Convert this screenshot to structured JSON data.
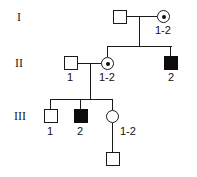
{
  "diagram": {
    "kind": "pedigree-chart",
    "colors": {
      "stroke": "#1a1a1a",
      "affected_fill": "#0d0d0d",
      "unaffected_fill": "#ffffff",
      "background": "#ffffff"
    }
  },
  "generations": [
    {
      "key": "gen1",
      "label": "I"
    },
    {
      "key": "gen2",
      "label": "II"
    },
    {
      "key": "gen3",
      "label": "III"
    }
  ],
  "individuals": [
    {
      "id": "i-1",
      "generation": "I",
      "sex": "male",
      "shape": "square",
      "status": "unaffected",
      "filled": false,
      "carrier": false,
      "label": ""
    },
    {
      "id": "i-2",
      "generation": "I",
      "sex": "female",
      "shape": "circle",
      "status": "carrier",
      "filled": false,
      "carrier": true,
      "label": "1-2"
    },
    {
      "id": "ii-1",
      "generation": "II",
      "sex": "male",
      "shape": "square",
      "status": "unaffected",
      "filled": false,
      "carrier": false,
      "label": "1"
    },
    {
      "id": "ii-2",
      "generation": "II",
      "sex": "female",
      "shape": "circle",
      "status": "carrier",
      "filled": false,
      "carrier": true,
      "label": "1-2"
    },
    {
      "id": "ii-3",
      "generation": "II",
      "sex": "male",
      "shape": "square",
      "status": "affected",
      "filled": true,
      "carrier": false,
      "label": "2"
    },
    {
      "id": "iii-1",
      "generation": "III",
      "sex": "male",
      "shape": "square",
      "status": "unaffected",
      "filled": false,
      "carrier": false,
      "label": "1"
    },
    {
      "id": "iii-2",
      "generation": "III",
      "sex": "male",
      "shape": "square",
      "status": "affected",
      "filled": true,
      "carrier": false,
      "label": "2"
    },
    {
      "id": "iii-3",
      "generation": "III",
      "sex": "female",
      "shape": "circle",
      "status": "unaffected",
      "filled": false,
      "carrier": false,
      "label": "1-2"
    },
    {
      "id": "iv-1",
      "generation": "IV",
      "sex": "male",
      "shape": "square",
      "status": "unaffected",
      "filled": false,
      "carrier": false,
      "label": ""
    }
  ]
}
